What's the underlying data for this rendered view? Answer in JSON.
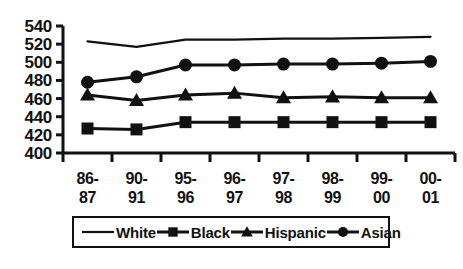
{
  "chart_data": {
    "type": "line",
    "title": "",
    "xlabel": "",
    "ylabel": "",
    "ylim": [
      400,
      540
    ],
    "ytick_step": 20,
    "yticks": [
      400,
      420,
      440,
      460,
      480,
      500,
      520,
      540
    ],
    "grid": false,
    "legend_position": "bottom",
    "categories": [
      "86-87",
      "90-91",
      "95-96",
      "96-97",
      "97-98",
      "98-99",
      "99-00",
      "00-01"
    ],
    "series": [
      {
        "name": "White",
        "marker": "none",
        "values": [
          523,
          517,
          525,
          525,
          526,
          526,
          527,
          528
        ]
      },
      {
        "name": "Black",
        "marker": "square",
        "values": [
          427,
          426,
          434,
          434,
          434,
          434,
          434,
          434
        ]
      },
      {
        "name": "Hispanic",
        "marker": "triangle",
        "values": [
          464,
          458,
          464,
          466,
          461,
          462,
          461,
          461
        ]
      },
      {
        "name": "Asian",
        "marker": "circle",
        "values": [
          478,
          484,
          497,
          497,
          498,
          498,
          499,
          501
        ]
      }
    ]
  },
  "axis": {
    "y_labels": [
      "540",
      "520",
      "500",
      "480",
      "460",
      "440",
      "420",
      "400"
    ],
    "x_labels_top": [
      "86-",
      "90-",
      "95-",
      "96-",
      "97-",
      "98-",
      "99-",
      "00-"
    ],
    "x_labels_bottom": [
      "87",
      "91",
      "96",
      "97",
      "98",
      "99",
      "00",
      "01"
    ]
  },
  "legend": {
    "items": [
      {
        "label": "White",
        "marker": "none"
      },
      {
        "label": "Black",
        "marker": "square"
      },
      {
        "label": "Hispanic",
        "marker": "triangle"
      },
      {
        "label": "Asian",
        "marker": "circle"
      }
    ]
  },
  "colors": {
    "ink": "#111111",
    "background": "#ffffff"
  }
}
